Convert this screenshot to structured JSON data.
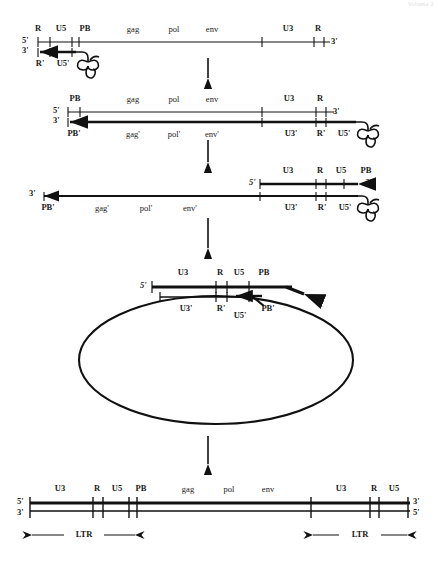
{
  "header": {
    "watermark": "Volume 2"
  },
  "diagram": {
    "colors": {
      "ink": "#111111",
      "background": "#ffffff"
    },
    "end_labels": {
      "five_prime": "5'",
      "three_prime": "3'"
    },
    "icons": {
      "trna": "trna-cloverleaf-icon",
      "step_arrow": "down-arrow-icon",
      "span_arrow": "double-headed-arrow-icon"
    },
    "stages": [
      {
        "id": "stage-1",
        "name": "genomic-rna-with-trna-primer",
        "top_strand": {
          "name": "plus-strand-rna",
          "left_end": "5'",
          "right_end": "3'",
          "labels": [
            "R",
            "U5",
            "PB",
            "gag",
            "pol",
            "env",
            "U3",
            "R"
          ]
        },
        "bottom_strand": {
          "name": "minus-strand-dna-ssdna",
          "left_end": "3'",
          "labels": [
            "R'",
            "U5'"
          ],
          "has_trna": true
        }
      },
      {
        "id": "stage-2",
        "name": "first-strand-transfer-minus-strand-synthesis",
        "top_strand": {
          "name": "plus-strand-rna",
          "left_end": "5'",
          "right_end": "3'",
          "labels": [
            "PB",
            "gag",
            "pol",
            "env",
            "U3",
            "R"
          ]
        },
        "bottom_strand": {
          "name": "minus-strand-dna",
          "left_end": "3'",
          "labels": [
            "PB'",
            "gag'",
            "pol'",
            "env'",
            "U3'",
            "R'",
            "U5'"
          ],
          "has_trna": true
        }
      },
      {
        "id": "stage-3",
        "name": "plus-strand-synthesis-from-pb",
        "top_strand": {
          "name": "plus-strand-dna",
          "left_end": "5'",
          "right_end": "3'",
          "labels": [
            "U3",
            "R",
            "U5",
            "PB"
          ]
        },
        "bottom_strand": {
          "name": "minus-strand-dna",
          "left_end": "3'",
          "labels": [
            "PB'",
            "gag'",
            "pol'",
            "env'",
            "U3'",
            "R'",
            "U5'"
          ],
          "has_trna": true
        }
      },
      {
        "id": "stage-4",
        "name": "second-strand-transfer-circular-intermediate",
        "top_strand": {
          "name": "plus-strand-dna",
          "left_end": "5'",
          "labels": [
            "U3",
            "R",
            "U5",
            "PB"
          ]
        },
        "bottom_strand": {
          "name": "minus-strand-dna",
          "labels": [
            "U3'",
            "R'",
            "U5'",
            "PB'"
          ]
        },
        "shape": "circle"
      },
      {
        "id": "stage-5",
        "name": "linear-double-stranded-provirus-with-ltrs",
        "top_strand": {
          "name": "plus-strand-dna",
          "left_end": "5'",
          "right_end": "3'",
          "labels": [
            "U3",
            "R",
            "U5",
            "PB",
            "gag",
            "pol",
            "env",
            "U3",
            "R",
            "U5"
          ]
        },
        "bottom_strand": {
          "name": "minus-strand-dna",
          "left_end": "3'",
          "right_end": "5'"
        },
        "spans": [
          {
            "name": "ltr-left",
            "label": "LTR"
          },
          {
            "name": "ltr-right",
            "label": "LTR"
          }
        ]
      }
    ]
  }
}
